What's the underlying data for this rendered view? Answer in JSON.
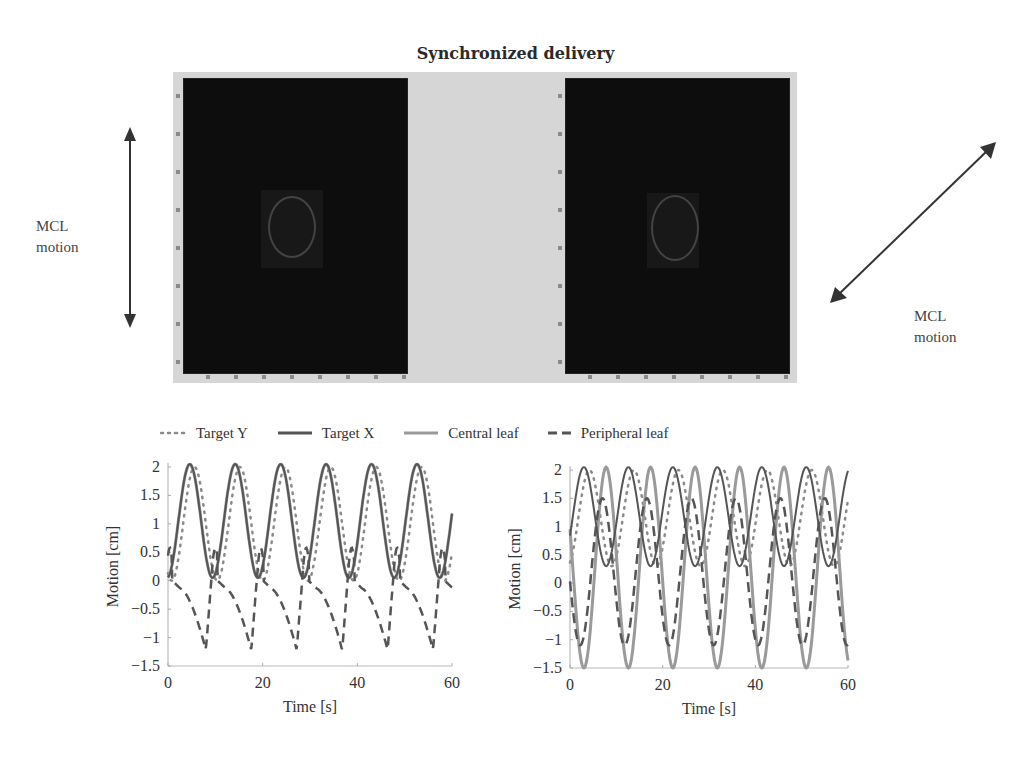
{
  "figure": {
    "title": "Synchronized delivery",
    "left_arrow_label": [
      "MCL",
      "motion"
    ],
    "right_arrow_label": [
      "MCL",
      "motion"
    ],
    "colors": {
      "background": "#ffffff",
      "image_band": "#d6d6d6",
      "image_panel": "#0d0d0d",
      "target_y": "#8a8a8a",
      "target_x": "#555555",
      "central_leaf": "#9a9a9a",
      "peripheral_leaf": "#555555"
    }
  },
  "legend": {
    "items": [
      {
        "label": "Target Y",
        "style": "dotted"
      },
      {
        "label": "Target X",
        "style": "solid-dark"
      },
      {
        "label": "Central leaf",
        "style": "solid-light"
      },
      {
        "label": "Peripheral leaf",
        "style": "dashed"
      }
    ]
  },
  "chart_data": [
    {
      "type": "line",
      "title": "",
      "xlabel": "Time [s]",
      "ylabel": "Motion [cm]",
      "xlim": [
        0,
        60
      ],
      "ylim": [
        -1.5,
        2
      ],
      "xticks": [
        0,
        20,
        40,
        60
      ],
      "yticks": [
        2,
        1.5,
        1,
        0.5,
        0,
        -0.5,
        -1,
        -1.5
      ],
      "ytick_labels": [
        "2",
        "1.5",
        "1",
        "0.5",
        "0",
        "−0.5",
        "−1",
        "−1.5"
      ],
      "grid": false,
      "legend_position": "top (shared)",
      "period_s": 9.6,
      "series": [
        {
          "name": "Target Y",
          "style": "dotted",
          "min": 0.0,
          "max": 2.0,
          "phase_peak_s": 5.6,
          "peaks_x": [
            5.6,
            15.2,
            24.8,
            34.4,
            44.0,
            53.6
          ]
        },
        {
          "name": "Target X",
          "style": "solid",
          "min": 0.05,
          "max": 2.05,
          "phase_peak_s": 4.6,
          "peaks_x": [
            4.6,
            14.2,
            23.8,
            33.4,
            43.0,
            52.6
          ]
        },
        {
          "name": "Central leaf",
          "style": "solid-light",
          "min": 0.05,
          "max": 2.05,
          "phase_peak_s": 4.6,
          "peaks_x": [
            4.6,
            14.2,
            23.8,
            33.4,
            43.0,
            52.6
          ]
        },
        {
          "name": "Peripheral leaf",
          "style": "dashed",
          "min": -1.25,
          "max": 0.55,
          "troughs_x": [
            8.0,
            17.2,
            26.8,
            36.4,
            45.8,
            55.4
          ],
          "troughs_y": [
            -1.2,
            -1.25,
            -1.2,
            -1.2,
            -1.25,
            -1.25
          ]
        }
      ]
    },
    {
      "type": "line",
      "title": "",
      "xlabel": "Time [s]",
      "ylabel": "Motion [cm]",
      "xlim": [
        0,
        60
      ],
      "ylim": [
        -1.5,
        2
      ],
      "xticks": [
        0,
        20,
        40,
        60
      ],
      "yticks": [
        2,
        1.5,
        1,
        0.5,
        0,
        -0.5,
        -1,
        -1.5
      ],
      "ytick_labels": [
        "2",
        "1.5",
        "1",
        "0.5",
        "0",
        "−0.5",
        "−1",
        "−1.5"
      ],
      "grid": false,
      "legend_position": "top (shared)",
      "period_s": 9.6,
      "series": [
        {
          "name": "Target Y",
          "style": "dotted",
          "min": 0.3,
          "max": 2.0,
          "phase_peak_s": 4.2,
          "peaks_x": [
            4.2,
            13.8,
            23.4,
            33.0,
            42.6,
            52.2
          ]
        },
        {
          "name": "Target X",
          "style": "solid",
          "min": 0.3,
          "max": 2.05,
          "phase_peak_s": 3.0,
          "peaks_x": [
            3.0,
            12.6,
            22.2,
            31.8,
            41.4,
            51.0,
            60.0
          ]
        },
        {
          "name": "Central leaf",
          "style": "solid-light",
          "min": -1.5,
          "max": 0.9,
          "phase_trough_s": 3.0,
          "troughs_x": [
            3.0,
            12.6,
            22.2,
            31.8,
            41.4,
            51.0
          ]
        },
        {
          "name": "Peripheral leaf",
          "style": "dashed",
          "min": -1.1,
          "max": 1.5,
          "peaks_x": [
            7.0,
            16.6,
            26.2,
            35.8,
            45.4,
            55.0
          ]
        }
      ]
    }
  ]
}
